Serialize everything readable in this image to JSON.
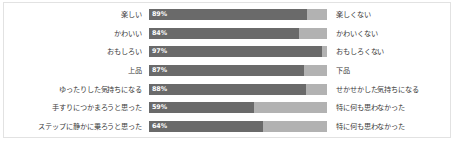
{
  "chart_data": {
    "type": "bar",
    "title": "",
    "subtitle": "",
    "xlabel": "",
    "ylabel": "",
    "xlim": [
      0,
      100
    ],
    "grid": false,
    "legend_position": "none",
    "orientation": "horizontal",
    "stacked": true,
    "unit": "%",
    "colors": {
      "positive_bar": "#6a6a6a",
      "remainder_bar": "#b2b2b2",
      "label_text": "#3b3b3b",
      "value_text": "#ffffff",
      "frame_border": "#e2e2e2",
      "background": "#ffffff"
    },
    "series": [
      {
        "name": "positive",
        "values": [
          89,
          84,
          97,
          87,
          88,
          59,
          64
        ]
      },
      {
        "name": "remainder",
        "values": [
          11,
          16,
          3,
          13,
          12,
          41,
          36
        ]
      }
    ],
    "categories": [
      "楽しい",
      "かわいい",
      "おもしろい",
      "上品",
      "ゆったりした気持ちになる",
      "手すりにつかまろうと思った",
      "ステップに静かに乗ろうと思った"
    ],
    "opposite_categories": [
      "楽しくない",
      "かわいくない",
      "おもしろくない",
      "下品",
      "せかせかした気持ちになる",
      "特に何も思わなかった",
      "特に何も思わなかった"
    ],
    "rows": [
      {
        "left_label": "楽しい",
        "right_label": "楽しくない",
        "value": 89,
        "value_label": "89%"
      },
      {
        "left_label": "かわいい",
        "right_label": "かわいくない",
        "value": 84,
        "value_label": "84%"
      },
      {
        "left_label": "おもしろい",
        "right_label": "おもしろくない",
        "value": 97,
        "value_label": "97%"
      },
      {
        "left_label": "上品",
        "right_label": "下品",
        "value": 87,
        "value_label": "87%"
      },
      {
        "left_label": "ゆったりした気持ちになる",
        "right_label": "せかせかした気持ちになる",
        "value": 88,
        "value_label": "88%"
      },
      {
        "left_label": "手すりにつかまろうと思った",
        "right_label": "特に何も思わなかった",
        "value": 59,
        "value_label": "59%"
      },
      {
        "left_label": "ステップに静かに乗ろうと思った",
        "right_label": "特に何も思わなかった",
        "value": 64,
        "value_label": "64%"
      }
    ]
  },
  "footnote": ""
}
